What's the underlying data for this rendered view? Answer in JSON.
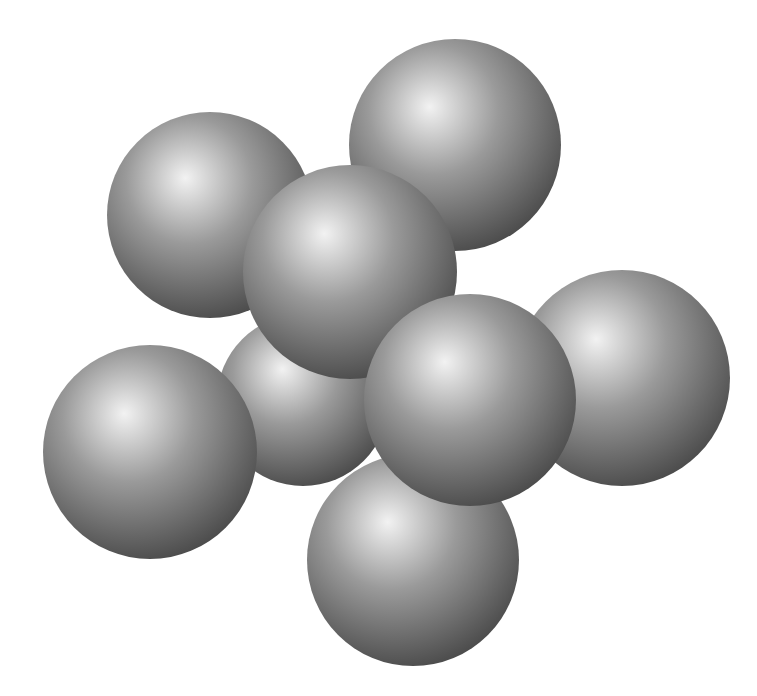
{
  "diagram": {
    "title": "",
    "type": "sphere-cluster",
    "sphere_count": 8,
    "colors": {
      "background": "#ffffff",
      "highlight": "#f2f2f2",
      "mid": "#9a9a9a",
      "shadow": "#4a4a4a"
    },
    "spheres": [
      {
        "id": "top-left"
      },
      {
        "id": "top-right"
      },
      {
        "id": "back-center"
      },
      {
        "id": "middle"
      },
      {
        "id": "right"
      },
      {
        "id": "left"
      },
      {
        "id": "bottom-center"
      },
      {
        "id": "front-center"
      }
    ]
  }
}
